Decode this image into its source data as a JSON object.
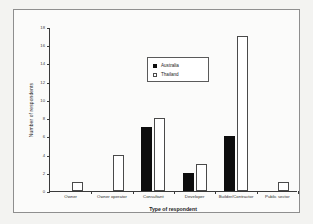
{
  "chart_data": {
    "type": "bar",
    "title": "",
    "xlabel": "Type of respondent",
    "ylabel": "Number of respondents",
    "ylim": [
      0,
      18
    ],
    "yticks": [
      0,
      2,
      4,
      6,
      8,
      10,
      12,
      14,
      16,
      18
    ],
    "grid": false,
    "legend_position": "upper-center",
    "categories": [
      "Owner",
      "Owner operator",
      "Consultant",
      "Developer",
      "Builder/Contractor",
      "Public sector"
    ],
    "series": [
      {
        "name": "Australia",
        "color": "#0d0d0d",
        "values": [
          0,
          0,
          7,
          2,
          6,
          0
        ]
      },
      {
        "name": "Thailand",
        "color": "#ffffff",
        "values": [
          1,
          4,
          8,
          3,
          17,
          1
        ]
      }
    ]
  }
}
